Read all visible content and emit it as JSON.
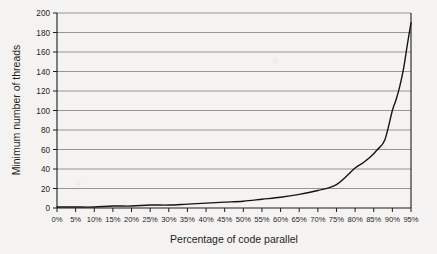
{
  "chart_data": {
    "type": "line",
    "title": "",
    "xlabel": "Percentage of code parallel",
    "ylabel": "Minimum number of threads",
    "xlim": [
      0,
      95
    ],
    "ylim": [
      0,
      200
    ],
    "grid": true,
    "legend": null,
    "x_tick_labels": [
      "0%",
      "5%",
      "10%",
      "15%",
      "20%",
      "25%",
      "30%",
      "35%",
      "40%",
      "45%",
      "50%",
      "55%",
      "60%",
      "65%",
      "70%",
      "75%",
      "80%",
      "85%",
      "90%",
      "95%"
    ],
    "x_tick_values": [
      0,
      5,
      10,
      15,
      20,
      25,
      30,
      35,
      40,
      45,
      50,
      55,
      60,
      65,
      70,
      75,
      80,
      85,
      90,
      95
    ],
    "y_tick_labels": [
      "0",
      "20",
      "40",
      "60",
      "80",
      "100",
      "120",
      "140",
      "160",
      "180",
      "200"
    ],
    "y_tick_values": [
      0,
      20,
      40,
      60,
      80,
      100,
      120,
      140,
      160,
      180,
      200
    ],
    "series": [
      {
        "name": "Minimum number of threads",
        "x": [
          0,
          5,
          10,
          15,
          20,
          25,
          30,
          35,
          40,
          45,
          50,
          55,
          60,
          65,
          70,
          75,
          80,
          82,
          84,
          86,
          88,
          90,
          91,
          92,
          93,
          94,
          95
        ],
        "values": [
          1,
          1,
          1,
          2,
          2,
          3,
          3,
          4,
          5,
          6,
          7,
          9,
          11,
          14,
          18,
          24,
          41,
          46,
          52,
          60,
          70,
          100,
          111,
          125,
          143,
          167,
          190
        ]
      }
    ]
  },
  "axis": {
    "x_title": "Percentage of code parallel",
    "y_title": "Minimum number of threads"
  }
}
